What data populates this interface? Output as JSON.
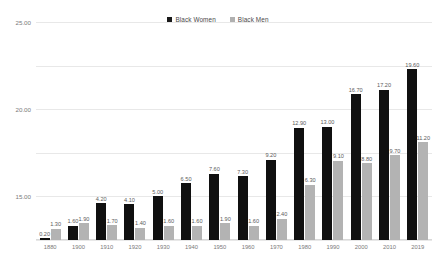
{
  "legend": {
    "items": [
      {
        "label": "Black Women",
        "color": "#101010",
        "key": "women"
      },
      {
        "label": "Black Men",
        "color": "#b3b3b3",
        "key": "men"
      }
    ]
  },
  "axis": {
    "y_ticks": [
      "25.00",
      "20.00",
      "15.00",
      "10.00",
      "5.00",
      "0.00"
    ]
  },
  "chart_data": {
    "type": "bar",
    "title": "",
    "subtitle": "",
    "xlabel": "",
    "ylabel": "",
    "ylim": [
      0,
      25
    ],
    "ytick_values": [
      0,
      5,
      10,
      15,
      20,
      25
    ],
    "ytick_labels": [
      "0.00",
      "5.00",
      "10.00",
      "15.00",
      "20.00",
      "25.00"
    ],
    "grid": true,
    "grid_axis": "y",
    "legend_position": "top-center",
    "value_labels": true,
    "value_label_format": "0.00",
    "categories": [
      "1880",
      "1900",
      "1910",
      "1920",
      "1930",
      "1940",
      "1950",
      "1960",
      "1970",
      "1980",
      "1990",
      "2000",
      "2010",
      "2019"
    ],
    "series": [
      {
        "name": "Black Women",
        "color": "#101010",
        "values": [
          0.2,
          1.6,
          4.2,
          4.1,
          5.0,
          6.5,
          7.6,
          7.3,
          9.2,
          12.9,
          13.0,
          16.7,
          17.2,
          19.6
        ],
        "labels": [
          "0.20",
          "1.60",
          "4.20",
          "4.10",
          "5.00",
          "6.50",
          "7.60",
          "7.30",
          "9.20",
          "12.90",
          "13.00",
          "16.70",
          "17.20",
          "19.60"
        ]
      },
      {
        "name": "Black Men",
        "color": "#b3b3b3",
        "values": [
          1.3,
          1.9,
          1.7,
          1.4,
          1.6,
          1.6,
          1.9,
          1.6,
          2.4,
          6.3,
          9.1,
          8.8,
          9.7,
          8.9
        ],
        "labels": [
          "1.30",
          "1.90",
          "1.70",
          "1.40",
          "1.60",
          "1.60",
          "1.90",
          "1.60",
          "2.40",
          "6.30",
          "9.10",
          "8.80",
          "9.70",
          "8.90"
        ]
      }
    ],
    "extra_points": [
      {
        "category": "2019",
        "series": "Black Men",
        "value": 11.2,
        "label": "11.20"
      }
    ]
  }
}
